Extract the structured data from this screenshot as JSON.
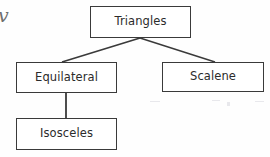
{
  "diagram": {
    "type": "hierarchy-tree",
    "background_color": "#fefefe",
    "border_color": "#3a3a3a",
    "text_color": "#2b2b2b",
    "nodes": [
      {
        "id": "triangles",
        "label": "Triangles",
        "level": 0
      },
      {
        "id": "equilateral",
        "label": "Equilateral",
        "level": 1
      },
      {
        "id": "scalene",
        "label": "Scalene",
        "level": 1
      },
      {
        "id": "isosceles",
        "label": "Isosceles",
        "level": 2
      }
    ],
    "edges": [
      {
        "from": "triangles",
        "to": "equilateral",
        "style": "diagonal"
      },
      {
        "from": "triangles",
        "to": "scalene",
        "style": "diagonal"
      },
      {
        "from": "equilateral",
        "to": "isosceles",
        "style": "vertical"
      }
    ],
    "margin_artifact": "v"
  }
}
